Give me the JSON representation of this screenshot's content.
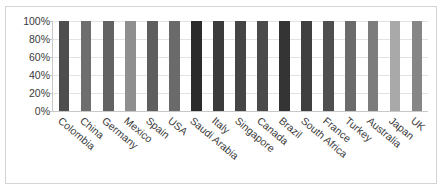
{
  "chart_data": {
    "type": "bar",
    "title": "",
    "subtitle": "",
    "xlabel": "",
    "ylabel": "",
    "ylim": [
      0,
      100
    ],
    "grid": true,
    "legend": false,
    "y_tick_labels": [
      "100%",
      "80%",
      "60%",
      "40%",
      "20%",
      "0%"
    ],
    "y_tick_values": [
      100,
      80,
      60,
      40,
      20,
      0
    ],
    "categories": [
      "Colombia",
      "China",
      "Germany",
      "Mexico",
      "Spain",
      "USA",
      "Saudi Arabia",
      "Italy",
      "Singapore",
      "Canada",
      "Brazil",
      "South Africa",
      "France",
      "Turkey",
      "Australia",
      "Japan",
      "UK"
    ],
    "values": [
      100,
      100,
      100,
      100,
      100,
      100,
      100,
      100,
      100,
      100,
      100,
      100,
      100,
      100,
      100,
      100,
      100
    ],
    "bar_colors": [
      "#4d4d4d",
      "#6e6e6e",
      "#636363",
      "#8f8f8f",
      "#5e5e5e",
      "#6a6a6a",
      "#2b2b2b",
      "#3b3b3b",
      "#454545",
      "#4a4a4a",
      "#343434",
      "#3f3f3f",
      "#4f4f4f",
      "#6b6b6b",
      "#7c7c7c",
      "#a9a9a9",
      "#868686"
    ]
  },
  "axis": {
    "axis_line_color": "#c8c8c8",
    "gridline_color": "#e3e3e3"
  },
  "frame": {
    "border_color": "#d4d4d4",
    "background_color": "#ffffff"
  }
}
